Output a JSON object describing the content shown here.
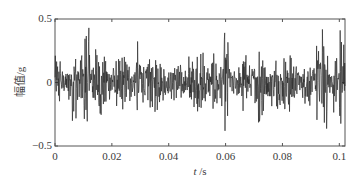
{
  "chart_data": {
    "type": "line",
    "title": "",
    "xlabel_var": "t",
    "xlabel_unit": "/s",
    "ylabel": "幅值/g",
    "xlim": [
      0,
      0.102
    ],
    "ylim": [
      -0.5,
      0.5
    ],
    "xticks": [
      0,
      0.02,
      0.04,
      0.06,
      0.08,
      0.1
    ],
    "xtick_labels": [
      "0",
      "0.02",
      "0.04",
      "0.06",
      "0.08",
      "0.1"
    ],
    "yticks": [
      -0.5,
      0,
      0.5
    ],
    "ytick_labels": [
      "−0.5",
      "0",
      "0.5"
    ],
    "grid": false,
    "legend": null,
    "series": [
      {
        "name": "vibration signal",
        "color": "#2b2b2b",
        "description": "dense random vibration acceleration time signal, approx ±0.15 g typical, peaks up to ~0.43 g and troughs down to ~−0.41 g",
        "peak_max": 0.43,
        "peak_min": -0.41
      }
    ]
  }
}
